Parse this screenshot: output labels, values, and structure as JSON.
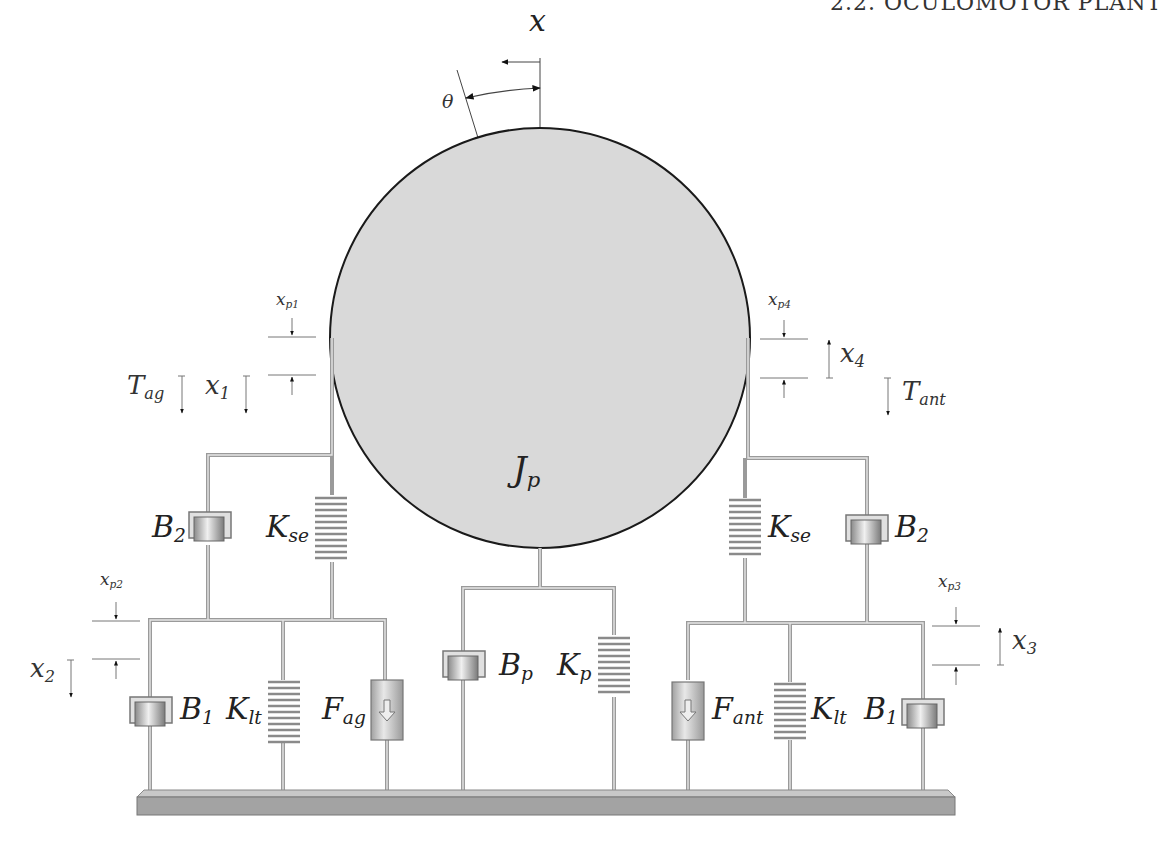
{
  "header": {
    "text": "2.2. OCULOMOTOR PLANT  "
  },
  "diagram": {
    "colors": {
      "plant_fill": "#d9d9d9",
      "plant_stroke": "#1a1a1a",
      "wire": "#a8a8a8",
      "base_top": "#c4c4c4",
      "base_front": "#9e9e9e",
      "label": "#222222"
    },
    "top": {
      "x_label": "x",
      "theta_label": "θ"
    },
    "plant": {
      "label_main": "J",
      "label_sub": "p"
    },
    "left": {
      "tension": {
        "main": "T",
        "sub": "ag"
      },
      "x1": {
        "main": "x",
        "sub": "1"
      },
      "xp1": {
        "main": "x",
        "sub": "p1"
      },
      "xp2": {
        "main": "x",
        "sub": "p2"
      },
      "x2": {
        "main": "x",
        "sub": "2"
      },
      "B2": {
        "main": "B",
        "sub": "2"
      },
      "Kse": {
        "main": "K",
        "sub": "se"
      },
      "B1": {
        "main": "B",
        "sub": "1"
      },
      "Klt": {
        "main": "K",
        "sub": "lt"
      },
      "F": {
        "main": "F",
        "sub": "ag"
      }
    },
    "center": {
      "Bp": {
        "main": "B",
        "sub": "p"
      },
      "Kp": {
        "main": "K",
        "sub": "p"
      }
    },
    "right": {
      "tension": {
        "main": "T",
        "sub": "ant"
      },
      "x4": {
        "main": "x",
        "sub": "4"
      },
      "xp4": {
        "main": "x",
        "sub": "p4"
      },
      "xp3": {
        "main": "x",
        "sub": "p3"
      },
      "x3": {
        "main": "x",
        "sub": "3"
      },
      "B2": {
        "main": "B",
        "sub": "2"
      },
      "Kse": {
        "main": "K",
        "sub": "se"
      },
      "B1": {
        "main": "B",
        "sub": "1"
      },
      "Klt": {
        "main": "K",
        "sub": "lt"
      },
      "F": {
        "main": "F",
        "sub": "ant"
      }
    },
    "icons": {
      "damper": "dashpot-icon",
      "spring": "coil-spring-icon",
      "force": "force-generator-icon",
      "ground": "ground-base-icon"
    }
  }
}
